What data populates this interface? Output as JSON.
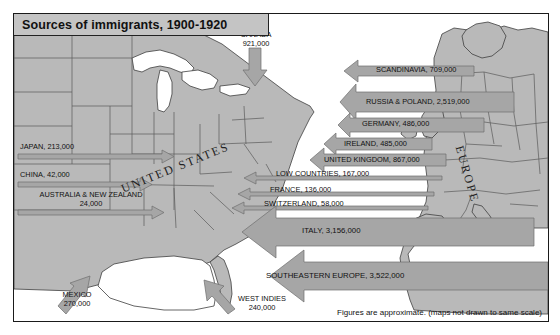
{
  "title": "Sources of immigrants, 1900-1920",
  "footer": "Figures are approximate.  (maps not drawn to same scale)",
  "region_names": {
    "united_states": "UNITED STATES",
    "europe": "EUROPE"
  },
  "colors": {
    "land": "#b9b9b9",
    "water": "#ffffff",
    "arrow": "#a6a6a6",
    "title_bar": "#c4c4c4",
    "border": "#1a1a1a",
    "text": "#111111"
  },
  "flows": [
    {
      "id": "canada",
      "label": "CANADA",
      "value": "921,000",
      "direction": "down"
    },
    {
      "id": "japan",
      "label": "JAPAN, 213,000",
      "value": "213,000",
      "direction": "right"
    },
    {
      "id": "china",
      "label": "CHINA, 42,000",
      "value": "42,000",
      "direction": "right"
    },
    {
      "id": "australia_nz",
      "label": "AUSTRALIA & NEW ZEALAND",
      "value": "24,000",
      "direction": "right"
    },
    {
      "id": "mexico",
      "label": "MEXICO",
      "value": "270,000",
      "direction": "up-right"
    },
    {
      "id": "west_indies",
      "label": "WEST INDIES",
      "value": "240,000",
      "direction": "up-left"
    },
    {
      "id": "scandinavia",
      "label": "SCANDINAVIA, 709,000",
      "value": "709,000",
      "direction": "left"
    },
    {
      "id": "russia_poland",
      "label": "RUSSIA & POLAND, 2,519,000",
      "value": "2,519,000",
      "direction": "left"
    },
    {
      "id": "germany",
      "label": "GERMANY, 486,000",
      "value": "486,000",
      "direction": "left"
    },
    {
      "id": "ireland",
      "label": "IRELAND, 485,000",
      "value": "485,000",
      "direction": "left"
    },
    {
      "id": "united_kingdom",
      "label": "UNITED KINGDOM, 867,000",
      "value": "867,000",
      "direction": "left"
    },
    {
      "id": "low_countries",
      "label": "LOW COUNTRIES, 167,000",
      "value": "167,000",
      "direction": "left"
    },
    {
      "id": "france",
      "label": "FRANCE, 136,000",
      "value": "136,000",
      "direction": "left"
    },
    {
      "id": "switzerland",
      "label": "SWITZERLAND, 58,000",
      "value": "58,000",
      "direction": "left"
    },
    {
      "id": "italy",
      "label": "ITALY, 3,156,000",
      "value": "3,156,000",
      "direction": "left"
    },
    {
      "id": "se_europe",
      "label": "SOUTHEASTERN EUROPE, 3,522,000",
      "value": "3,522,000",
      "direction": "left"
    }
  ],
  "canada_label_line1": "CANADA",
  "canada_label_line2": "921,000",
  "mexico_label_line1": "MEXICO",
  "mexico_label_line2": "270,000",
  "west_indies_line1": "WEST INDIES",
  "west_indies_line2": "240,000",
  "aunz_line1": "AUSTRALIA & NEW ZEALAND",
  "aunz_line2": "24,000"
}
